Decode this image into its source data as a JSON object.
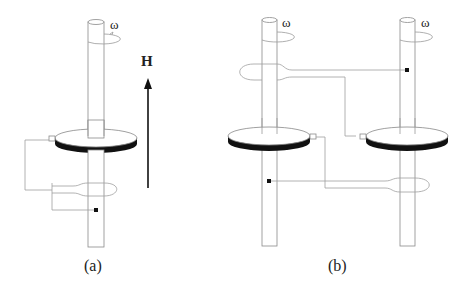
{
  "figure": {
    "panels": [
      {
        "id": "a",
        "caption": "(a)",
        "omega_label": "ω"
      },
      {
        "id": "b",
        "caption": "(b)",
        "omega_labels": [
          "ω",
          "ω"
        ]
      }
    ],
    "field_label": "H",
    "colors": {
      "line": "#9a9a9a",
      "disk_rim": "#111111",
      "text": "#222222"
    }
  }
}
